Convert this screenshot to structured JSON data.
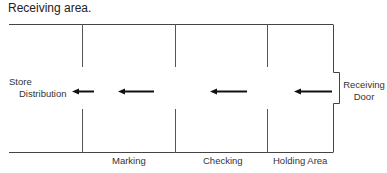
{
  "title": "Receiving area.",
  "labels": {
    "store": "Store",
    "distribution": "Distribution",
    "receiving": "Receiving",
    "door": "Door"
  },
  "zones": [
    {
      "label": "Marking"
    },
    {
      "label": "Checking"
    },
    {
      "label": "Holding Area"
    }
  ],
  "flow_direction": "right-to-left",
  "colors": {
    "line": "#333333",
    "arrow": "#111111",
    "text": "#222222"
  }
}
